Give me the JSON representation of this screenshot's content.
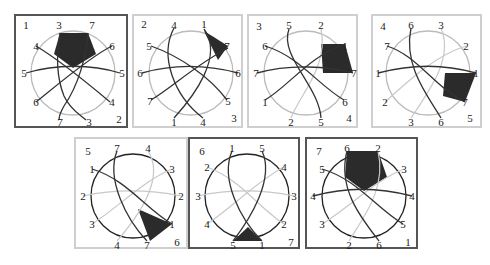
{
  "figure": {
    "colors": {
      "dark_line": "#333333",
      "light_line": "#c8c8c8",
      "fill": "#2b2b2b",
      "circle": "#999999"
    },
    "panels": [
      {
        "id": 1,
        "border": "dark",
        "corner_label": "1",
        "corner2_label": "2",
        "labels": [
          {
            "t": "1",
            "x": 10,
            "y": 9
          },
          {
            "t": "3",
            "x": 43,
            "y": 9
          },
          {
            "t": "7",
            "x": 76,
            "y": 9
          },
          {
            "t": "4",
            "x": 20,
            "y": 30
          },
          {
            "t": "6",
            "x": 96,
            "y": 30
          },
          {
            "t": "5",
            "x": 8,
            "y": 57
          },
          {
            "t": "5",
            "x": 106,
            "y": 57
          },
          {
            "t": "6",
            "x": 20,
            "y": 86
          },
          {
            "t": "4",
            "x": 96,
            "y": 86
          },
          {
            "t": "7",
            "x": 44,
            "y": 106
          },
          {
            "t": "3",
            "x": 73,
            "y": 106
          },
          {
            "t": "2",
            "x": 103,
            "y": 103
          }
        ]
      },
      {
        "id": 2,
        "border": "light",
        "labels": [
          {
            "t": "2",
            "x": 10,
            "y": 8
          },
          {
            "t": "4",
            "x": 40,
            "y": 9
          },
          {
            "t": "1",
            "x": 70,
            "y": 8
          },
          {
            "t": "5",
            "x": 15,
            "y": 30
          },
          {
            "t": "7",
            "x": 93,
            "y": 30
          },
          {
            "t": "6",
            "x": 6,
            "y": 57
          },
          {
            "t": "6",
            "x": 104,
            "y": 57
          },
          {
            "t": "7",
            "x": 16,
            "y": 85
          },
          {
            "t": "5",
            "x": 94,
            "y": 85
          },
          {
            "t": "1",
            "x": 40,
            "y": 106
          },
          {
            "t": "4",
            "x": 69,
            "y": 106
          },
          {
            "t": "3",
            "x": 100,
            "y": 102
          }
        ]
      },
      {
        "id": 3,
        "border": "light",
        "labels": [
          {
            "t": "3",
            "x": 10,
            "y": 10
          },
          {
            "t": "5",
            "x": 40,
            "y": 9
          },
          {
            "t": "2",
            "x": 72,
            "y": 9
          },
          {
            "t": "6",
            "x": 16,
            "y": 30
          },
          {
            "t": "1",
            "x": 96,
            "y": 30
          },
          {
            "t": "7",
            "x": 7,
            "y": 57
          },
          {
            "t": "7",
            "x": 105,
            "y": 57
          },
          {
            "t": "1",
            "x": 16,
            "y": 86
          },
          {
            "t": "6",
            "x": 96,
            "y": 86
          },
          {
            "t": "2",
            "x": 42,
            "y": 106
          },
          {
            "t": "5",
            "x": 72,
            "y": 106
          },
          {
            "t": "4",
            "x": 100,
            "y": 102
          }
        ]
      },
      {
        "id": 4,
        "border": "light",
        "labels": [
          {
            "t": "4",
            "x": 10,
            "y": 10
          },
          {
            "t": "6",
            "x": 38,
            "y": 9
          },
          {
            "t": "3",
            "x": 68,
            "y": 9
          },
          {
            "t": "7",
            "x": 14,
            "y": 30
          },
          {
            "t": "2",
            "x": 93,
            "y": 30
          },
          {
            "t": "1",
            "x": 5,
            "y": 57
          },
          {
            "t": "1",
            "x": 103,
            "y": 57
          },
          {
            "t": "2",
            "x": 12,
            "y": 86
          },
          {
            "t": "7",
            "x": 92,
            "y": 86
          },
          {
            "t": "3",
            "x": 38,
            "y": 106
          },
          {
            "t": "6",
            "x": 68,
            "y": 106
          },
          {
            "t": "5",
            "x": 97,
            "y": 102
          }
        ]
      },
      {
        "id": 5,
        "border": "light",
        "labels": [
          {
            "t": "5",
            "x": 12,
            "y": 12
          },
          {
            "t": "7",
            "x": 41,
            "y": 9
          },
          {
            "t": "4",
            "x": 72,
            "y": 9
          },
          {
            "t": "1",
            "x": 16,
            "y": 30
          },
          {
            "t": "3",
            "x": 96,
            "y": 30
          },
          {
            "t": "2",
            "x": 7,
            "y": 57
          },
          {
            "t": "2",
            "x": 105,
            "y": 57
          },
          {
            "t": "3",
            "x": 16,
            "y": 85
          },
          {
            "t": "1",
            "x": 96,
            "y": 85
          },
          {
            "t": "4",
            "x": 41,
            "y": 106
          },
          {
            "t": "7",
            "x": 71,
            "y": 106
          },
          {
            "t": "6",
            "x": 101,
            "y": 103
          }
        ]
      },
      {
        "id": 6,
        "border": "dark",
        "labels": [
          {
            "t": "6",
            "x": 12,
            "y": 12
          },
          {
            "t": "1",
            "x": 42,
            "y": 9
          },
          {
            "t": "5",
            "x": 72,
            "y": 9
          },
          {
            "t": "2",
            "x": 17,
            "y": 28
          },
          {
            "t": "4",
            "x": 94,
            "y": 28
          },
          {
            "t": "3",
            "x": 8,
            "y": 57
          },
          {
            "t": "3",
            "x": 104,
            "y": 57
          },
          {
            "t": "4",
            "x": 17,
            "y": 85
          },
          {
            "t": "2",
            "x": 94,
            "y": 85
          },
          {
            "t": "5",
            "x": 43,
            "y": 106
          },
          {
            "t": "1",
            "x": 72,
            "y": 106
          },
          {
            "t": "7",
            "x": 101,
            "y": 103
          }
        ]
      },
      {
        "id": 7,
        "border": "dark",
        "labels": [
          {
            "t": "7",
            "x": 12,
            "y": 12
          },
          {
            "t": "6",
            "x": 40,
            "y": 9
          },
          {
            "t": "2",
            "x": 71,
            "y": 9
          },
          {
            "t": "5",
            "x": 15,
            "y": 30
          },
          {
            "t": "3",
            "x": 97,
            "y": 30
          },
          {
            "t": "4",
            "x": 6,
            "y": 57
          },
          {
            "t": "4",
            "x": 105,
            "y": 57
          },
          {
            "t": "3",
            "x": 15,
            "y": 85
          },
          {
            "t": "5",
            "x": 96,
            "y": 85
          },
          {
            "t": "2",
            "x": 42,
            "y": 106
          },
          {
            "t": "6",
            "x": 72,
            "y": 106
          },
          {
            "t": "1",
            "x": 101,
            "y": 103
          }
        ]
      }
    ]
  }
}
